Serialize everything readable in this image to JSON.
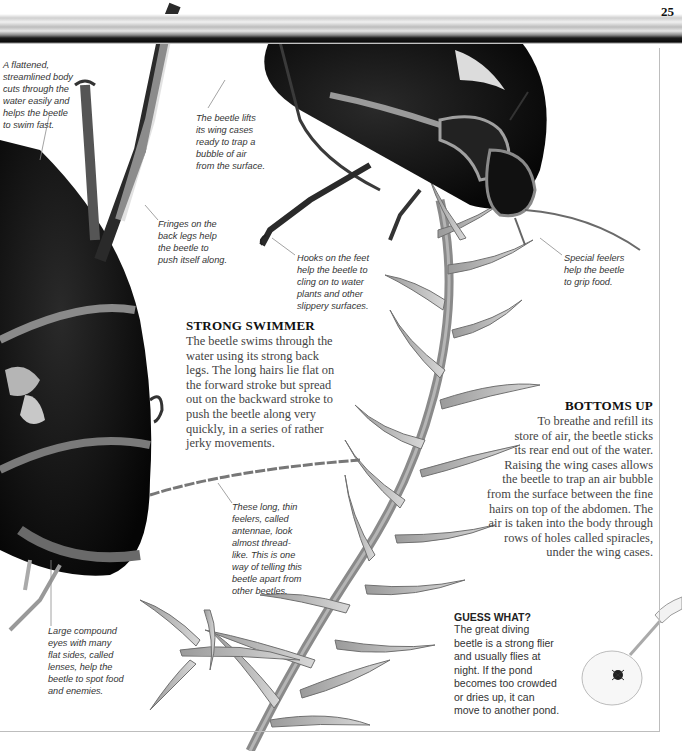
{
  "page": {
    "number": "25",
    "colors": {
      "background": "#ffffff",
      "beetle_body": "#0a0a0a",
      "beetle_rim": "#8a8a8a",
      "plant": "#7a7a7a",
      "rule": "#bdbdbd"
    }
  },
  "captions": {
    "streamlined": [
      "A flattened,",
      "streamlined body",
      "cuts through the",
      "water easily and",
      "helps the beetle",
      "to swim fast."
    ],
    "wing_cases": [
      "The beetle lifts",
      "its wing cases",
      "ready to trap a",
      "bubble of air",
      "from the surface."
    ],
    "fringes": [
      "Fringes on the",
      "back legs help",
      "the beetle to",
      "push itself along."
    ],
    "hooks": [
      "Hooks on the feet",
      "help the beetle to",
      "cling on to water",
      "plants and other",
      "slippery surfaces."
    ],
    "feelers": [
      "Special feelers",
      "help the beetle",
      "to grip food."
    ],
    "antennae": [
      "These long, thin",
      "feelers, called",
      "antennae, look",
      "almost thread-",
      "like. This is one",
      "way of telling this",
      "beetle apart from",
      "other beetles."
    ],
    "eyes": [
      "Large compound",
      "eyes with many",
      "flat sides, called",
      "lenses, help the",
      "beetle to spot food",
      "and enemies."
    ]
  },
  "sections": {
    "strong_swimmer": {
      "heading": "STRONG SWIMMER",
      "lines": [
        "The beetle swims through the",
        "water using its strong back",
        "legs. The long hairs lie flat on",
        "the forward stroke but spread",
        "out on the backward stroke to",
        "push the beetle along very",
        "quickly, in a series of rather",
        "jerky movements."
      ]
    },
    "bottoms_up": {
      "heading": "BOTTOMS UP",
      "lines": [
        "To breathe and refill its",
        "store of air, the beetle sticks",
        "its rear end out of the water.",
        "Raising the wing cases allows",
        "the beetle to trap an air bubble",
        "from the surface between the fine",
        "hairs on top of the abdomen. The",
        "air is taken into the body through",
        "rows of holes called spiracles,",
        "under the wing cases."
      ]
    },
    "guess_what": {
      "heading": "GUESS WHAT?",
      "lines": [
        "The great diving",
        "beetle is a strong flier",
        "and usually flies at",
        "night. If the pond",
        "becomes too crowded",
        "or dries up, it can",
        "move to another pond."
      ]
    }
  },
  "illustrations": {
    "top_beetle": "diving-beetle-side-view",
    "left_beetle": "diving-beetle-close-up",
    "plant": "pondweed-stem",
    "net": "hand-net-with-beetle"
  }
}
